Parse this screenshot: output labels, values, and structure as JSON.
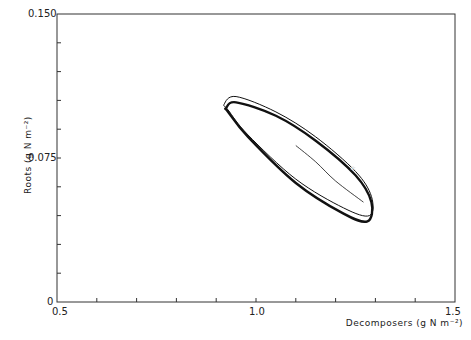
{
  "chart_data": {
    "type": "line",
    "title": "",
    "xlabel": "Decomposers (g N m⁻²)",
    "ylabel": "Roots (g N m⁻²)",
    "xlim": [
      0.5,
      1.5
    ],
    "ylim": [
      0,
      0.15
    ],
    "x_tick_labels": [
      "0.5",
      "1.0",
      "1.5"
    ],
    "y_tick_labels": [
      "0",
      "0.075",
      "0.150"
    ],
    "x_minor_step": 0.1,
    "y_minor_step": 0.015,
    "grid": false,
    "series": [
      {
        "name": "limit cycle (outer)",
        "style": "thin",
        "description": "phase trajectory closed loop",
        "x": [
          0.92,
          0.95,
          1.05,
          1.15,
          1.25,
          1.29,
          1.285,
          1.22,
          1.1,
          0.98,
          0.93,
          0.92
        ],
        "y": [
          0.103,
          0.107,
          0.099,
          0.086,
          0.068,
          0.055,
          0.045,
          0.049,
          0.064,
          0.087,
          0.1,
          0.103
        ]
      },
      {
        "name": "limit cycle (inner)",
        "style": "thick",
        "x": [
          0.925,
          0.95,
          1.05,
          1.15,
          1.25,
          1.29,
          1.28,
          1.22,
          1.1,
          0.98,
          0.93,
          0.925
        ],
        "y": [
          0.101,
          0.104,
          0.097,
          0.084,
          0.066,
          0.052,
          0.042,
          0.046,
          0.062,
          0.086,
          0.099,
          0.101
        ]
      },
      {
        "name": "initial trajectory",
        "style": "thin",
        "x": [
          1.1,
          1.15,
          1.2,
          1.27
        ],
        "y": [
          0.0815,
          0.073,
          0.063,
          0.052
        ]
      }
    ],
    "annotations": [
      {
        "type": "equilibrium-marker",
        "x": 1.245,
        "y": 0.069
      }
    ]
  }
}
